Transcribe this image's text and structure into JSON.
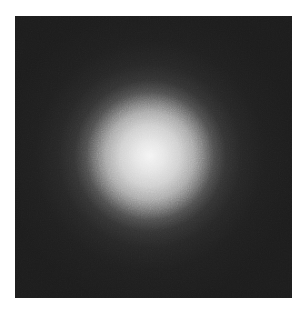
{
  "image": {
    "description": "grayscale noisy gaussian blob on dark background",
    "colors": {
      "background": "#ffffff",
      "field": "#1c1c1c",
      "core": "#f4f4f4"
    }
  }
}
